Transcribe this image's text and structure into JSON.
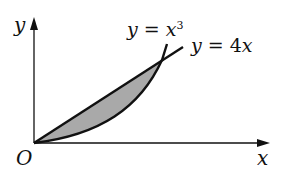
{
  "diagram": {
    "type": "area-between-curves",
    "axes": {
      "x_label": "x",
      "y_label": "y",
      "origin_label": "O"
    },
    "curves": [
      {
        "name": "cubic",
        "label_lhs": "y",
        "label_eq": "=",
        "label_rhs": "x",
        "label_exp": "3"
      },
      {
        "name": "line",
        "label_lhs": "y",
        "label_eq": "=",
        "label_rhs": "4x"
      }
    ],
    "shaded_region": {
      "description": "Region between y = 4x and y = x^3 in the first quadrant",
      "fill_color": "#a9a9a9"
    },
    "colors": {
      "stroke": "#111111",
      "background": "#ffffff"
    }
  }
}
